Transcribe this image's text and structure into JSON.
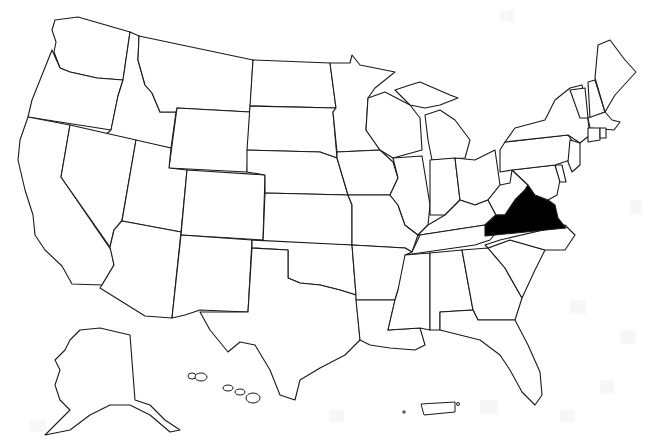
{
  "map": {
    "title": "United States map",
    "highlighted_state": "Virginia",
    "highlight_color": "#000000",
    "outline_color": "#1a1a1a",
    "fill_color": "#ffffff",
    "background_color": "#ffffff",
    "watermark_color": "#f2f2f2",
    "includes_insets": [
      "Alaska",
      "Hawaii",
      "Puerto Rico"
    ]
  }
}
